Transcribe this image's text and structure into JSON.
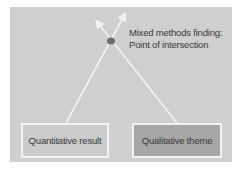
{
  "diagram": {
    "finding_label_line1": "Mixed methods finding:",
    "finding_label_line2": "Point of intersection",
    "boxes": [
      {
        "label": "Quantitative result",
        "fill": "#cbcbcb"
      },
      {
        "label": "Qualitative theme",
        "fill": "#a6a6a6"
      }
    ],
    "colors": {
      "panel": "#cfcfcf",
      "lines": "#f2f2f2",
      "dot": "#6e6e6e"
    }
  }
}
